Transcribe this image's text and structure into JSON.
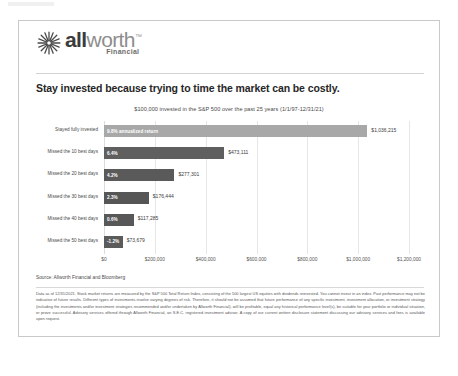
{
  "brand": {
    "logo_all": "all",
    "logo_worth": "worth",
    "logo_tm": "™",
    "logo_sub": "Financial",
    "logo_mark_icon": "starburst-icon",
    "accent_dark": "#3b3b3b",
    "accent_gray": "#8e8e8e"
  },
  "headline": "Stay invested because trying to time the market can be costly.",
  "source_note": "Source: Allworth Financial and Bloomberg",
  "disclaimer": "Data as of 12/31/2021. Stock market returns are measured by the S&P 500 Total Return Index, consisting of the 500 largest US equities with dividends reinvested. You cannot invest in an index. Past performance may not be indicative of future results. Different types of investments involve varying degrees of risk. Therefore, it should not be assumed that future performance of any specific investment, investment allocation, or investment strategy (including the investments and/or investment strategies recommended and/or undertaken by Allworth Financial), will be profitable, equal any historical performance level(s), be suitable for your portfolio or individual situation, or prove successful. Advisory services offered through Allworth Financial, an S.E.C. registered investment advisor. A copy of our current written disclosure statement discussing our advisory services and fees is available upon request.",
  "chart_data": {
    "type": "bar",
    "orientation": "horizontal",
    "title": "$100,000 invested in the S&P 500 over the past 25 years (1/1/97-12/31/21)",
    "xlabel": "",
    "ylabel": "",
    "xlim": [
      0,
      1200000
    ],
    "grid": true,
    "legend": "none",
    "xticks": [
      0,
      200000,
      400000,
      600000,
      800000,
      1000000,
      1200000
    ],
    "xtick_labels": [
      "$0",
      "$200,000",
      "$400,000",
      "$600,000",
      "$800,000",
      "$1,000,000",
      "$1,200,000"
    ],
    "categories": [
      "Stayed fully invested",
      "Missed the 10 best days",
      "Missed the 20 best days",
      "Missed the 30 best days",
      "Missed the 40 best days",
      "Missed the 50 best days"
    ],
    "values": [
      1036215,
      473111,
      277301,
      176444,
      117285,
      73679
    ],
    "value_labels": [
      "$1,036,215",
      "$473,111",
      "$277,301",
      "$176,444",
      "$117,285",
      "$73,679"
    ],
    "bar_labels": [
      "9.8% annualized return",
      "6.4%",
      "4.2%",
      "2.3%",
      "0.6%",
      "-1.2%"
    ],
    "bar_colors": [
      "#a8a8a8",
      "#5f5f5f",
      "#5a5a5a",
      "#565656",
      "#585858",
      "#5b5b5b"
    ]
  }
}
